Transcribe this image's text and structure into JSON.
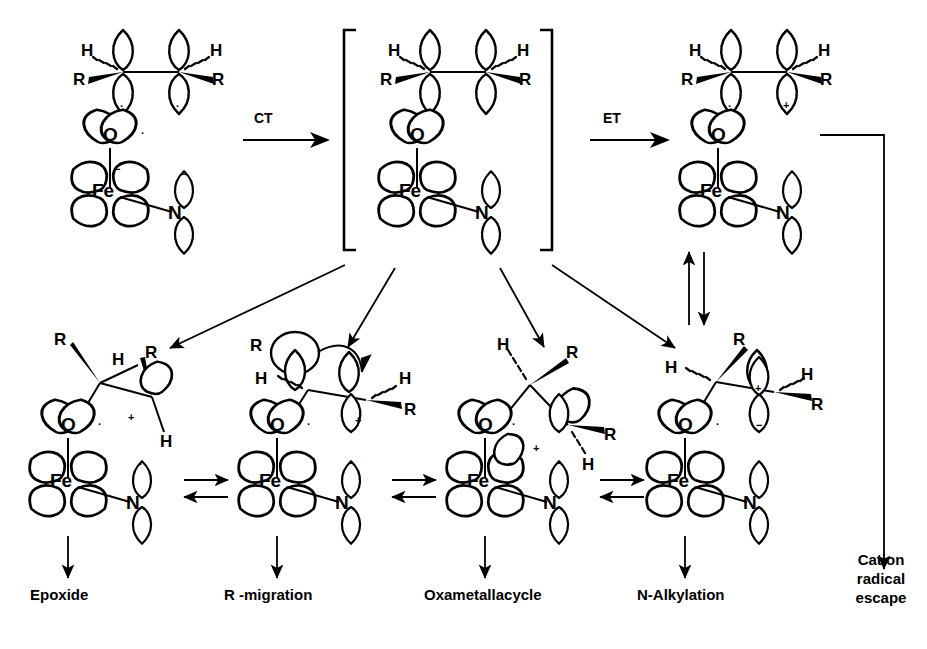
{
  "figure": {
    "type": "reaction-mechanism-diagram",
    "line_color": "#000000",
    "background": "#ffffff"
  },
  "atoms": {
    "iron": "Fe",
    "oxygen": "O",
    "nitrogen": "N"
  },
  "substituents": {
    "r": "R",
    "h": "H"
  },
  "charges": {
    "radical": "·",
    "plus": "+",
    "minus": "−"
  },
  "reaction_steps": {
    "ct": "CT",
    "et": "ET"
  },
  "structures": [
    {
      "id": "reactants",
      "name": "alkene-plus-iron-oxo",
      "bracketed": false,
      "alkene": {
        "left": {
          "up": "",
          "down": "·",
          "h": "H",
          "r": "R"
        },
        "right": {
          "up": "",
          "down": "·",
          "h": "H",
          "r": "R"
        }
      },
      "metal": {
        "o_right": "·",
        "fe_right": "−",
        "n_top": "−"
      }
    },
    {
      "id": "ct-complex",
      "name": "charge-transfer-complex",
      "bracketed": true,
      "alkene": {
        "left": {
          "up": "",
          "down": "",
          "h": "H",
          "r": "R"
        },
        "right": {
          "up": "",
          "down": "",
          "h": "H",
          "r": "R"
        }
      },
      "metal": {
        "o_right": "",
        "fe_right": "",
        "n_top": ""
      }
    },
    {
      "id": "radical-cation",
      "name": "alkene-radical-cation-complex",
      "bracketed": false,
      "alkene": {
        "left": {
          "up": "",
          "down": "·",
          "h": "H",
          "r": "R"
        },
        "right": {
          "up": "",
          "down": "+",
          "h": "H",
          "r": "R"
        }
      },
      "metal": {
        "o_right": "",
        "fe_right": "",
        "n_top": ""
      }
    }
  ],
  "products": [
    {
      "id": "epoxide",
      "label": "Epoxide"
    },
    {
      "id": "r-migration",
      "label": "R -migration"
    },
    {
      "id": "oxametallacycle",
      "label": "Oxametallacycle"
    },
    {
      "id": "n-alkylation",
      "label": "N-Alkylation"
    },
    {
      "id": "cation-escape",
      "label": "Cation\nradical\nescape",
      "line1": "Cation",
      "line2": "radical",
      "line3": "escape"
    }
  ],
  "bottom_structures": [
    {
      "id": "epoxide-int",
      "o_right": "·",
      "extra": "+",
      "fe_right": "",
      "n_top": "·",
      "r_top": "R",
      "h_top": "H",
      "r_right": "R",
      "h_right": "H"
    },
    {
      "id": "r-migration-int",
      "o_right": "·",
      "extra": "+",
      "fe_right": "",
      "n_top": "−",
      "r_top": "R",
      "h_left": "H",
      "h_right": "H",
      "r_right": "R"
    },
    {
      "id": "oxametallacycle-int",
      "o_right": "·",
      "extra": "+",
      "fe_right": "−",
      "n_top": "−",
      "h_top": "H",
      "r_top": "R",
      "r_right": "R",
      "h_right": "H"
    },
    {
      "id": "n-alkylation-int",
      "o_right": "·",
      "extra": "+",
      "fe_right": "−",
      "n_top": "−",
      "r_top": "R",
      "h_left": "H",
      "h_right": "H",
      "r_right": "R"
    }
  ],
  "equilibria": {
    "count": 3,
    "orientation": "horizontal",
    "style": "double-half-arrows"
  },
  "vertical_equilibrium": {
    "between": [
      "radical-cation",
      "n-alkylation-int"
    ]
  }
}
